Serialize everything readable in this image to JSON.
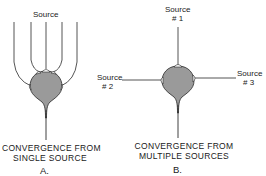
{
  "panel_a": {
    "source_label": "Source",
    "caption_line1": "CONVERGENCE  FROM",
    "caption_line2": "SINGLE  SOURCE",
    "letter": "A."
  },
  "panel_b": {
    "source1_label": "Source",
    "source1_num": "# 1",
    "source2_label": "Source",
    "source2_num": "# 2",
    "source3_label": "Source",
    "source3_num": "# 3",
    "caption_line1": "CONVERGENCE   FROM",
    "caption_line2": "MULTIPLE  SOURCES",
    "letter": "B."
  },
  "colors": {
    "line": "#2a2a2a",
    "soma_fill": "#9a9a9a",
    "terminal_fill": "#ffffff"
  }
}
